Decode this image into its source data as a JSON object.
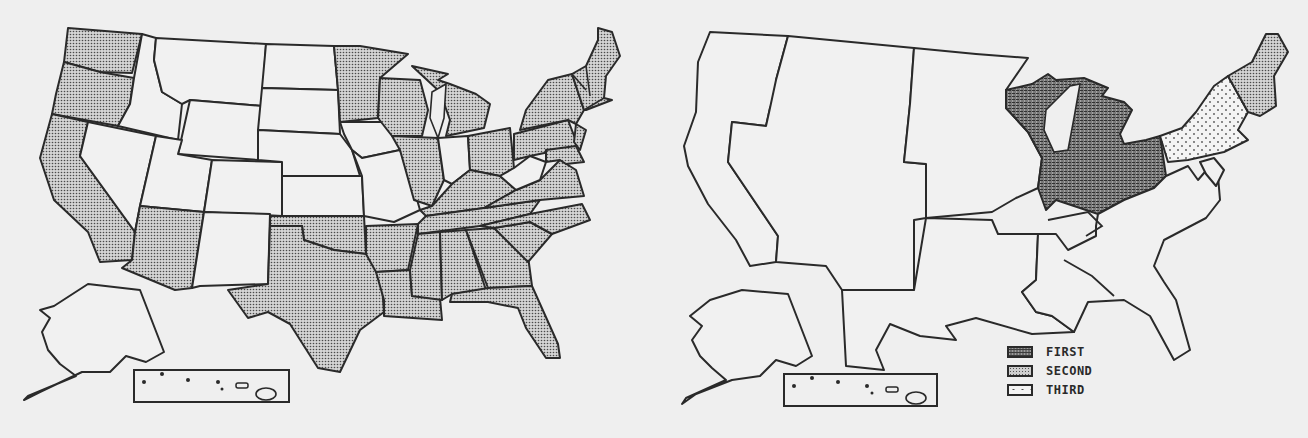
{
  "figure": {
    "colors": {
      "outline": "#2a2a2a",
      "background": "#efefef",
      "unshaded": "#f1f1f1",
      "first": "#6e6e6e",
      "second": "#cfcfcf",
      "third": "#f4f4f4"
    }
  },
  "left_map": {
    "shading": "second",
    "shaded_states": [
      "WA",
      "OR",
      "CA",
      "AZ",
      "TX",
      "OK",
      "AR",
      "LA",
      "MS",
      "AL",
      "GA",
      "FL",
      "SC",
      "NC",
      "TN",
      "KY",
      "VA",
      "MN",
      "WI",
      "MI",
      "IL",
      "OH",
      "PA",
      "NY",
      "NJ",
      "MD",
      "DE",
      "CT",
      "RI",
      "MA",
      "VT",
      "NH",
      "ME"
    ],
    "unshaded_states": [
      "ID",
      "MT",
      "WY",
      "NV",
      "UT",
      "CO",
      "NM",
      "ND",
      "SD",
      "NE",
      "KS",
      "IA",
      "MO",
      "IN",
      "WV",
      "AK",
      "HI"
    ]
  },
  "right_map": {
    "regions": [
      {
        "name": "West",
        "shading": "none"
      },
      {
        "name": "Plains",
        "shading": "none"
      },
      {
        "name": "South Central",
        "shading": "none"
      },
      {
        "name": "Great Lakes (WI, MI, IL, IN, OH)",
        "shading": "first"
      },
      {
        "name": "Mid-Atlantic (NY, PA, NJ)",
        "shading": "third"
      },
      {
        "name": "New England",
        "shading": "second"
      },
      {
        "name": "Southeast / Atlantic coast",
        "shading": "none"
      }
    ]
  },
  "legend": {
    "items": [
      {
        "key": "first",
        "label": "FIRST"
      },
      {
        "key": "second",
        "label": "SECOND"
      },
      {
        "key": "third",
        "label": "THIRD"
      }
    ]
  }
}
